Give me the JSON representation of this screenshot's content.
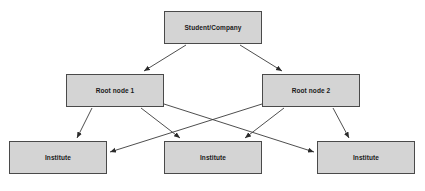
{
  "diagram": {
    "type": "hierarchy-flowchart",
    "background_color": "#ffffff",
    "node_fill_color": "#d4d4d4",
    "node_border_color": "#4a4a4a",
    "edge_color": "#333333",
    "nodes": [
      {
        "id": "student",
        "label": "Student/Company",
        "tier": "top"
      },
      {
        "id": "root1",
        "label": "Root node 1",
        "tier": "middle"
      },
      {
        "id": "root2",
        "label": "Root node 2",
        "tier": "middle"
      },
      {
        "id": "inst1",
        "label": "Institute",
        "tier": "bottom"
      },
      {
        "id": "inst2",
        "label": "Institute",
        "tier": "bottom"
      },
      {
        "id": "inst3",
        "label": "Institute",
        "tier": "bottom"
      }
    ],
    "edges": [
      {
        "from": "student",
        "to": "root1",
        "arrowhead": "target"
      },
      {
        "from": "student",
        "to": "root2",
        "arrowhead": "target"
      },
      {
        "from": "root1",
        "to": "inst1",
        "arrowhead": "target"
      },
      {
        "from": "root1",
        "to": "inst2",
        "arrowhead": "target"
      },
      {
        "from": "root1",
        "to": "inst3",
        "arrowhead": "target"
      },
      {
        "from": "root2",
        "to": "inst1",
        "arrowhead": "target"
      },
      {
        "from": "root2",
        "to": "inst2",
        "arrowhead": "target"
      },
      {
        "from": "root2",
        "to": "inst3",
        "arrowhead": "target"
      }
    ]
  }
}
